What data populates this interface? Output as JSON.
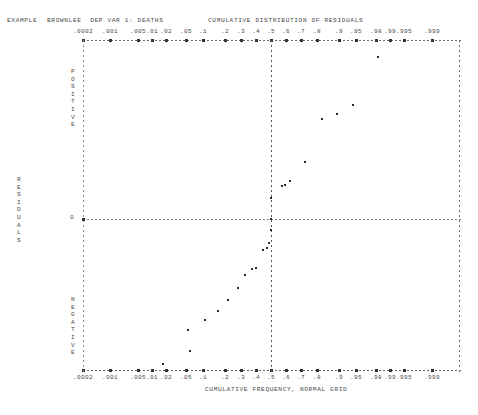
{
  "header": {
    "example_label": "EXAMPLE",
    "model_label": "BROWNLEE  DEP VAR 1: DEATHS",
    "main_title": "CUMULATIVE DISTRIBUTION OF RESIDUALS"
  },
  "axes": {
    "xlabel": "CUMULATIVE FREQUENCY, NORMAL GRID",
    "ylabel": "RESIDUALS",
    "upper_half_label": "POSITIVE",
    "lower_half_label": "NEGATIVE",
    "zero_label": "0"
  },
  "chart_data": {
    "type": "scatter",
    "title": "CUMULATIVE DISTRIBUTION OF RESIDUALS",
    "subtitle": "EXAMPLE  BROWNLEE  DEP VAR 1: DEATHS",
    "xlabel": "CUMULATIVE FREQUENCY, NORMAL GRID",
    "ylabel": "RESIDUALS",
    "grid": "normal-probability",
    "x_scale": "probit",
    "x_tick_labels": [
      ".0002",
      ".001",
      ".005",
      ".01",
      ".02",
      ".05",
      ".1",
      ".2",
      ".3",
      ".4",
      ".5",
      ".6",
      ".7",
      ".8",
      ".9",
      ".95",
      ".98",
      ".99",
      ".995",
      ".999"
    ],
    "x_tick_values": [
      0.0002,
      0.001,
      0.005,
      0.01,
      0.02,
      0.05,
      0.1,
      0.2,
      0.3,
      0.4,
      0.5,
      0.6,
      0.7,
      0.8,
      0.9,
      0.95,
      0.98,
      0.99,
      0.995,
      0.999
    ],
    "x_tick_px": [
      83,
      110,
      138,
      152,
      166,
      186,
      203,
      225,
      241,
      256,
      271,
      286,
      301,
      317,
      339,
      356,
      376,
      390,
      404,
      432
    ],
    "y_zero_px": 219,
    "plot_top_px": 40,
    "plot_bottom_px": 370,
    "plot_left_px": 83,
    "plot_right_px": 459,
    "reference_lines": {
      "vertical_median_px": 271,
      "horizontal_zero_px": 219,
      "right_border_px": 459
    },
    "legend": "none",
    "n_points": 21,
    "points": [
      {
        "x": 0.976,
        "y_px": 57,
        "x_px": 378,
        "residual_sign": "positive"
      },
      {
        "x": 0.905,
        "y_px": 105,
        "x_px": 353,
        "residual_sign": "positive"
      },
      {
        "x": 0.855,
        "y_px": 114,
        "x_px": 337,
        "residual_sign": "positive"
      },
      {
        "x": 0.8,
        "y_px": 119,
        "x_px": 322,
        "residual_sign": "positive"
      },
      {
        "x": 0.725,
        "y_px": 162,
        "x_px": 305,
        "residual_sign": "positive"
      },
      {
        "x": 0.64,
        "y_px": 181,
        "x_px": 290,
        "residual_sign": "positive"
      },
      {
        "x": 0.59,
        "y_px": 185,
        "x_px": 285,
        "residual_sign": "positive"
      },
      {
        "x": 0.57,
        "y_px": 186,
        "x_px": 282,
        "residual_sign": "positive"
      },
      {
        "x": 0.5,
        "y_px": 198,
        "x_px": 271,
        "residual_sign": "positive"
      },
      {
        "x": 0.5,
        "y_px": 219,
        "x_px": 271,
        "residual_sign": "zero"
      },
      {
        "x": 0.5,
        "y_px": 230,
        "x_px": 271,
        "residual_sign": "negative"
      },
      {
        "x": 0.49,
        "y_px": 243,
        "x_px": 269,
        "residual_sign": "negative"
      },
      {
        "x": 0.48,
        "y_px": 248,
        "x_px": 267,
        "residual_sign": "negative"
      },
      {
        "x": 0.455,
        "y_px": 250,
        "x_px": 263,
        "residual_sign": "negative"
      },
      {
        "x": 0.4,
        "y_px": 268,
        "x_px": 256,
        "residual_sign": "negative"
      },
      {
        "x": 0.38,
        "y_px": 269,
        "x_px": 252,
        "residual_sign": "negative"
      },
      {
        "x": 0.34,
        "y_px": 275,
        "x_px": 245,
        "residual_sign": "negative"
      },
      {
        "x": 0.3,
        "y_px": 288,
        "x_px": 238,
        "residual_sign": "negative"
      },
      {
        "x": 0.255,
        "y_px": 300,
        "x_px": 228,
        "residual_sign": "negative"
      },
      {
        "x": 0.21,
        "y_px": 311,
        "x_px": 218,
        "residual_sign": "negative"
      },
      {
        "x": 0.16,
        "y_px": 320,
        "x_px": 205,
        "residual_sign": "negative"
      },
      {
        "x": 0.105,
        "y_px": 330,
        "x_px": 188,
        "residual_sign": "negative"
      },
      {
        "x": 0.06,
        "y_px": 351,
        "x_px": 190,
        "residual_sign": "negative"
      },
      {
        "x": 0.022,
        "y_px": 364,
        "x_px": 163,
        "residual_sign": "negative"
      }
    ]
  }
}
